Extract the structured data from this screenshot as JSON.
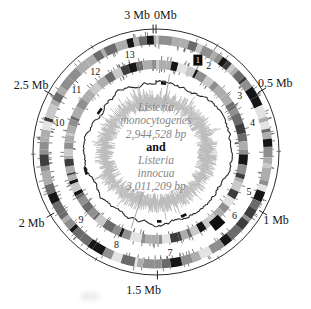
{
  "page": {
    "background": "#ffffff"
  },
  "chart_data": {
    "type": "circular-genome-map",
    "genomes": [
      {
        "name": "Listeria monocytogenes",
        "length_bp": 2944528,
        "length_label": "2,944,528 bp"
      },
      {
        "name": "Listeria innocua",
        "length_bp": 3011209,
        "length_label": "3,011,209 bp"
      }
    ],
    "center_labels": {
      "organism1": {
        "line1": "Listeria",
        "line2": "monocytogenes",
        "size": "2,944,528 bp"
      },
      "conjunction": "and",
      "organism2": {
        "line1": "Listeria",
        "line2": "innocua",
        "size": "3,011,209 bp"
      }
    },
    "scale": {
      "genome_length_mb": 3.011209,
      "unit": "Mb",
      "labels": [
        {
          "text": "3 Mb",
          "mb": 3.0,
          "anchor": "end",
          "x": 150,
          "y": 19
        },
        {
          "text": "0Mb",
          "mb": 0.0,
          "anchor": "start",
          "x": 154,
          "y": 19
        },
        {
          "text": "0.5 Mb",
          "mb": 0.5
        },
        {
          "text": "1 Mb",
          "mb": 1.0
        },
        {
          "text": "1.5 Mb",
          "mb": 1.5,
          "pad_x": -14
        },
        {
          "text": "2 Mb",
          "mb": 2.0,
          "pad_x": -6
        },
        {
          "text": "2.5 Mb",
          "mb": 2.5,
          "pad_x": -4
        }
      ],
      "minor_tick_mbs": [
        0.25,
        0.75,
        1.25,
        1.75,
        2.25,
        2.75
      ]
    },
    "segment_labels": [
      {
        "n": "1",
        "angle_deg": 24.5,
        "boxed": true
      },
      {
        "n": "2",
        "angle_deg": 31.5
      },
      {
        "n": "3",
        "angle_deg": 56
      },
      {
        "n": "4",
        "angle_deg": 73
      },
      {
        "n": "5",
        "angle_deg": 113
      },
      {
        "n": "6",
        "angle_deg": 129
      },
      {
        "n": "7",
        "angle_deg": 172
      },
      {
        "n": "8",
        "angle_deg": 203
      },
      {
        "n": "9",
        "angle_deg": 228
      },
      {
        "n": "10",
        "angle_deg": 287
      },
      {
        "n": "11",
        "angle_deg": 308
      },
      {
        "n": "12",
        "angle_deg": 323
      },
      {
        "n": "13",
        "angle_deg": 345
      }
    ],
    "rings": [
      {
        "id": "outer-scale-circle",
        "type": "circle",
        "r": 123,
        "color": "#2e2e2e",
        "width": 1
      },
      {
        "id": "outer-gene-ring",
        "type": "segments",
        "seed": 7,
        "r_mid": 112,
        "band": 9,
        "palette": [
          "#e3e3e3",
          "#c9c9c9",
          "#adadad",
          "#8f8f8f",
          "#6b6b6b",
          "#3d3d3d",
          "#161616"
        ],
        "weights": [
          0.05,
          0.18,
          0.27,
          0.22,
          0.12,
          0.08,
          0.08
        ],
        "tick_count": 185,
        "tick_color": "#4a4a4a"
      },
      {
        "id": "numbered-gene-ring",
        "type": "segments",
        "seed": 23,
        "r_mid": 87.5,
        "band": 9,
        "palette": [
          "#e3e3e3",
          "#c9c9c9",
          "#adadad",
          "#8f8f8f",
          "#6b6b6b",
          "#3d3d3d",
          "#161616"
        ],
        "weights": [
          0.05,
          0.16,
          0.26,
          0.23,
          0.13,
          0.09,
          0.08
        ],
        "tick_count": 170,
        "tick_color": "#4a4a4a",
        "black_arcs": [
          {
            "a0": 135.5,
            "a1": 143,
            "r_mid": 93.5,
            "width": 11
          }
        ]
      },
      {
        "id": "skew-line-ring",
        "type": "jagged-line",
        "seed": 91,
        "r_base": 71,
        "amp": 5.5,
        "color": "#2a2a2a",
        "width": 1.1,
        "dark_arc_count": 5
      },
      {
        "id": "similarity-spike-ring",
        "type": "spikes",
        "seed": 57,
        "r_in_min": 41,
        "r_in_max": 50,
        "r_out_min": 53,
        "r_out_max": 62,
        "color": "#b6b6b6",
        "long_spikes": [
          {
            "angle_deg": 10,
            "r1": 40,
            "r2": 79
          },
          {
            "angle_deg": 198,
            "r1": 42,
            "r2": 80
          }
        ]
      }
    ],
    "colors": {
      "text_gray": "#878787",
      "label_black": "#151515",
      "spike_gray": "#b6b6b6",
      "line_dark": "#2a2a2a"
    }
  }
}
